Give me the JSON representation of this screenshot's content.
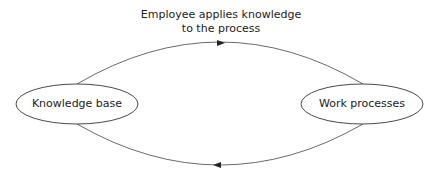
{
  "diagram": {
    "top_label_line1": "Employee applies knowledge",
    "top_label_line2": "to the process",
    "nodes": [
      {
        "id": "knowledge-base",
        "label": "Knowledge base"
      },
      {
        "id": "work-processes",
        "label": "Work processes"
      }
    ],
    "edges": [
      {
        "from": "knowledge-base",
        "to": "work-processes",
        "label": "Employee applies knowledge to the process"
      },
      {
        "from": "work-processes",
        "to": "knowledge-base",
        "label": ""
      }
    ],
    "colors": {
      "stroke": "#333333",
      "text": "#222222",
      "background": "#ffffff"
    }
  }
}
